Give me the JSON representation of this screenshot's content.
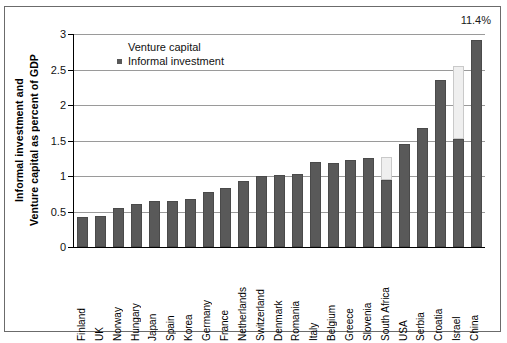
{
  "annotation": {
    "value_label": "11.4%"
  },
  "axis": {
    "y_title_line1": "Informal investment and",
    "y_title_line2": "Venture capital as percent of GDP",
    "y_ticks": [
      "0",
      "0.5",
      "1",
      "1.5",
      "2",
      "2.5",
      "3"
    ]
  },
  "legend": {
    "items": [
      {
        "label": "Venture capital",
        "color": "#efefef",
        "marker": "none"
      },
      {
        "label": "Informal investment",
        "color": "#595959",
        "marker": "square"
      }
    ]
  },
  "chart_data": {
    "type": "bar",
    "title": "",
    "xlabel": "",
    "ylabel": "Informal investment and Venture capital as percent of GDP",
    "ylim": [
      0,
      3
    ],
    "ytick_step": 0.5,
    "grid": true,
    "stacked": true,
    "legend_position": "top-left-inside",
    "annotations": [
      {
        "text": "11.4%",
        "refers_to": "China",
        "position": "top-right"
      }
    ],
    "categories": [
      "Finland",
      "UK",
      "Norway",
      "Hungary",
      "Japan",
      "Spain",
      "Korea",
      "Germany",
      "France",
      "Netherlands",
      "Switzerland",
      "Denmark",
      "Romania",
      "Italy",
      "Belgium",
      "Greece",
      "Slovenia",
      "South Africa",
      "USA",
      "Serbia",
      "Croatia",
      "Israel",
      "China"
    ],
    "series": [
      {
        "name": "Informal investment",
        "color": "#595959",
        "values": [
          0.42,
          0.44,
          0.55,
          0.6,
          0.65,
          0.65,
          0.68,
          0.78,
          0.83,
          0.93,
          1.0,
          1.02,
          1.03,
          1.2,
          1.18,
          1.23,
          1.25,
          0.95,
          1.45,
          1.67,
          2.35,
          1.52,
          2.92
        ]
      },
      {
        "name": "Venture capital",
        "color": "#efefef",
        "values": [
          0.0,
          0.0,
          0.0,
          0.0,
          0.0,
          0.0,
          0.0,
          0.0,
          0.0,
          0.0,
          0.0,
          0.0,
          0.0,
          0.0,
          0.0,
          0.0,
          0.0,
          0.32,
          0.0,
          0.0,
          0.0,
          1.03,
          0.0
        ]
      }
    ]
  }
}
